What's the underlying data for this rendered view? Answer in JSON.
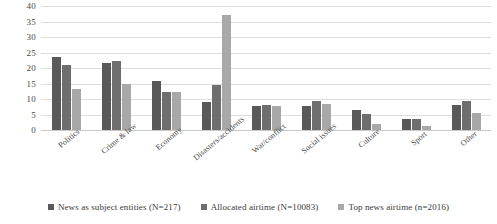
{
  "chart_data": {
    "type": "bar",
    "title": "",
    "subtitle": "",
    "xlabel": "",
    "ylabel": "",
    "ylim": [
      0,
      40
    ],
    "yticks": [
      0,
      5,
      10,
      15,
      20,
      25,
      30,
      35,
      40
    ],
    "grid": true,
    "legend_position": "bottom",
    "orientation": "vertical-grouped",
    "categories": [
      "Politics",
      "Crime & law",
      "Economy",
      "Disasters/accidents",
      "War/conflict",
      "Social issues",
      "Culture",
      "Sport",
      "Other"
    ],
    "series": [
      {
        "name": "News as subject entities (N=217)",
        "color": "#595959",
        "values": [
          23.5,
          21.7,
          15.8,
          9.0,
          7.8,
          7.8,
          6.5,
          3.7,
          8.0
        ]
      },
      {
        "name": "Allocated airtime (N=10083)",
        "color": "#6e6e6e",
        "values": [
          21.0,
          22.3,
          12.3,
          14.5,
          8.0,
          9.2,
          5.1,
          3.5,
          9.3
        ]
      },
      {
        "name": "Top news airtime (n=2016)",
        "color": "#a8a8a8",
        "values": [
          13.3,
          15.0,
          12.2,
          37.0,
          7.6,
          8.3,
          1.9,
          1.4,
          5.4
        ]
      }
    ]
  },
  "legend": {
    "items": [
      {
        "label": "News as subject entities (N=217)"
      },
      {
        "label": "Allocated airtime (N=10083)"
      },
      {
        "label": "Top news airtime (n=2016)"
      }
    ]
  }
}
